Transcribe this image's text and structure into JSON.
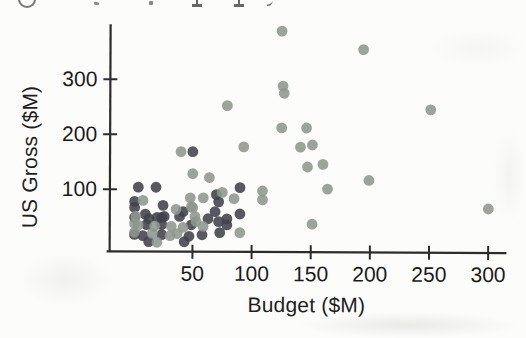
{
  "figure": {
    "kind": "scanned textbook scatterplot",
    "top_cropped_line": "illegible cropped text fragments (letter bottoms only)"
  },
  "colors": {
    "paper": "#fcfcfa",
    "axis": "#2c2c2c",
    "tick_label": "#1a1a1a",
    "dark_point": "#41414a",
    "light_point": "#8d968d"
  },
  "chart_data": {
    "type": "scatter",
    "title": "",
    "xlabel": "Budget ($M)",
    "ylabel": "US Gross ($M)",
    "xlim": [
      -20,
      318
    ],
    "ylim": [
      -13,
      400
    ],
    "x_ticks": [
      50,
      100,
      150,
      200,
      250,
      300
    ],
    "y_ticks": [
      100,
      200,
      300
    ],
    "grid": false,
    "legend": "none",
    "series": [
      {
        "name": "dark-points",
        "color": "#41414a",
        "points": [
          [
            50,
            169
          ],
          [
            4,
            104
          ],
          [
            19,
            104
          ],
          [
            90,
            104
          ],
          [
            90,
            56
          ],
          [
            1,
            78
          ],
          [
            70,
            91
          ],
          [
            72,
            78
          ],
          [
            63,
            47
          ],
          [
            72,
            42
          ],
          [
            69,
            60
          ],
          [
            25,
            71
          ],
          [
            1,
            67
          ],
          [
            42,
            60
          ],
          [
            1,
            49
          ],
          [
            13,
            47
          ],
          [
            24,
            49
          ],
          [
            39,
            51
          ],
          [
            11,
            36
          ],
          [
            24,
            36
          ],
          [
            49,
            36
          ],
          [
            79,
            36
          ],
          [
            1,
            18
          ],
          [
            8,
            16
          ],
          [
            24,
            18
          ],
          [
            47,
            15
          ],
          [
            58,
            18
          ],
          [
            73,
            22
          ],
          [
            13,
            5
          ],
          [
            43,
            5
          ],
          [
            10,
            55
          ],
          [
            20,
            49
          ],
          [
            26,
            51
          ],
          [
            79,
            47
          ]
        ]
      },
      {
        "name": "light-points",
        "color": "#8d968d",
        "points": [
          [
            125,
            389
          ],
          [
            194,
            356
          ],
          [
            126,
            289
          ],
          [
            127,
            276
          ],
          [
            79,
            253
          ],
          [
            251,
            247
          ],
          [
            125,
            213
          ],
          [
            146,
            213
          ],
          [
            93,
            178
          ],
          [
            141,
            178
          ],
          [
            151,
            182
          ],
          [
            147,
            142
          ],
          [
            160,
            147
          ],
          [
            199,
            118
          ],
          [
            164,
            102
          ],
          [
            300,
            67
          ],
          [
            151,
            38
          ],
          [
            40,
            169
          ],
          [
            50,
            129
          ],
          [
            64,
            122
          ],
          [
            109,
            98
          ],
          [
            109,
            82
          ],
          [
            85,
            84
          ],
          [
            48,
            85
          ],
          [
            49,
            69
          ],
          [
            90,
            22
          ],
          [
            8,
            80
          ],
          [
            75,
            95
          ],
          [
            59,
            85
          ],
          [
            36,
            64
          ],
          [
            50,
            67
          ],
          [
            53,
            42
          ],
          [
            1,
            38
          ],
          [
            4,
            35
          ],
          [
            18,
            33
          ],
          [
            32,
            33
          ],
          [
            42,
            31
          ],
          [
            59,
            33
          ],
          [
            1,
            22
          ],
          [
            16,
            20
          ],
          [
            31,
            16
          ],
          [
            37,
            20
          ],
          [
            20,
            4
          ],
          [
            2,
            51
          ],
          [
            52,
            51
          ]
        ]
      }
    ]
  }
}
